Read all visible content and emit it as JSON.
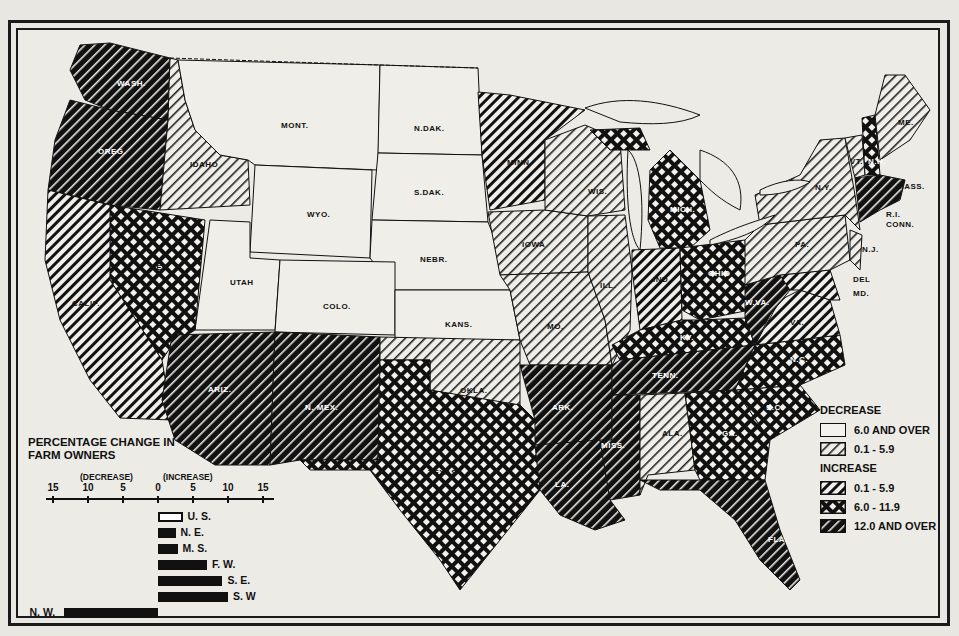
{
  "map": {
    "title_hint": "Percentage change in farm owners by state",
    "states": [
      {
        "abbr": "WASH.",
        "category": "inc_12_plus"
      },
      {
        "abbr": "OREG.",
        "category": "inc_12_plus"
      },
      {
        "abbr": "CALIF.",
        "category": "inc_0_1_5_9"
      },
      {
        "abbr": "IDAHO",
        "category": "dec_0_1_5_9"
      },
      {
        "abbr": "NEV.",
        "category": "inc_6_11_9"
      },
      {
        "abbr": "MONT.",
        "category": "dec_6_plus"
      },
      {
        "abbr": "WYO.",
        "category": "dec_6_plus"
      },
      {
        "abbr": "UTAH",
        "category": "dec_6_plus"
      },
      {
        "abbr": "COLO.",
        "category": "dec_6_plus"
      },
      {
        "abbr": "ARIZ.",
        "category": "inc_12_plus"
      },
      {
        "abbr": "N. MEX.",
        "category": "inc_12_plus"
      },
      {
        "abbr": "N.DAK.",
        "category": "dec_6_plus"
      },
      {
        "abbr": "S.DAK.",
        "category": "dec_6_plus"
      },
      {
        "abbr": "NEBR.",
        "category": "dec_6_plus"
      },
      {
        "abbr": "KANS.",
        "category": "dec_6_plus"
      },
      {
        "abbr": "OKLA.",
        "category": "dec_0_1_5_9"
      },
      {
        "abbr": "TEXAS",
        "category": "inc_6_11_9"
      },
      {
        "abbr": "MINN.",
        "category": "inc_0_1_5_9"
      },
      {
        "abbr": "IOWA",
        "category": "dec_0_1_5_9"
      },
      {
        "abbr": "MO.",
        "category": "dec_0_1_5_9"
      },
      {
        "abbr": "ARK.",
        "category": "inc_12_plus"
      },
      {
        "abbr": "LA.",
        "category": "inc_12_plus"
      },
      {
        "abbr": "WIS.",
        "category": "dec_0_1_5_9"
      },
      {
        "abbr": "ILL.",
        "category": "dec_0_1_5_9"
      },
      {
        "abbr": "MICH.",
        "category": "inc_6_11_9"
      },
      {
        "abbr": "IND.",
        "category": "inc_0_1_5_9"
      },
      {
        "abbr": "OHIO",
        "category": "inc_6_11_9"
      },
      {
        "abbr": "KY.",
        "category": "inc_6_11_9"
      },
      {
        "abbr": "TENN.",
        "category": "inc_12_plus"
      },
      {
        "abbr": "MISS.",
        "category": "inc_12_plus"
      },
      {
        "abbr": "ALA.",
        "category": "dec_0_1_5_9"
      },
      {
        "abbr": "GA.",
        "category": "inc_6_11_9"
      },
      {
        "abbr": "FLA.",
        "category": "inc_12_plus"
      },
      {
        "abbr": "S.C.",
        "category": "inc_6_11_9"
      },
      {
        "abbr": "N.C.",
        "category": "inc_6_11_9"
      },
      {
        "abbr": "VA.",
        "category": "inc_0_1_5_9"
      },
      {
        "abbr": "W.VA.",
        "category": "inc_12_plus"
      },
      {
        "abbr": "MD.",
        "category": "inc_0_1_5_9"
      },
      {
        "abbr": "DEL",
        "category": "inc_0_1_5_9"
      },
      {
        "abbr": "PA.",
        "category": "dec_0_1_5_9"
      },
      {
        "abbr": "N.J.",
        "category": "dec_0_1_5_9"
      },
      {
        "abbr": "N.Y.",
        "category": "dec_0_1_5_9"
      },
      {
        "abbr": "VT.",
        "category": "dec_0_1_5_9"
      },
      {
        "abbr": "N.H.",
        "category": "inc_6_11_9"
      },
      {
        "abbr": "ME.",
        "category": "dec_0_1_5_9"
      },
      {
        "abbr": "MASS.",
        "category": "inc_12_plus"
      },
      {
        "abbr": "R.I.",
        "category": "inc_12_plus"
      },
      {
        "abbr": "CONN.",
        "category": "inc_12_plus"
      }
    ]
  },
  "legend": {
    "decrease_heading": "DECREASE",
    "increase_heading": "INCREASE",
    "items": [
      {
        "key": "dec_6_plus",
        "label": "6.0 AND OVER"
      },
      {
        "key": "dec_0_1_5_9",
        "label": "0.1 -  5.9"
      },
      {
        "key": "inc_0_1_5_9",
        "label": "0.1 -  5.9"
      },
      {
        "key": "inc_6_11_9",
        "label": "6.0 - 11.9"
      },
      {
        "key": "inc_12_plus",
        "label": "12.0 AND OVER"
      }
    ]
  },
  "chart_data": {
    "type": "bar",
    "orientation": "horizontal",
    "title": "PERCENTAGE CHANGE IN FARM OWNERS",
    "xlabel_left": "(DECREASE)",
    "xlabel_right": "(INCREASE)",
    "xticks": [
      "15",
      "10",
      "5",
      "0",
      "5",
      "10",
      "15"
    ],
    "xlim": [
      -15,
      15
    ],
    "categories": [
      "U. S.",
      "N. E.",
      "M. S.",
      "F. W.",
      "S. E.",
      "S. W",
      "N. W."
    ],
    "values": [
      3.5,
      2.5,
      2.8,
      7.0,
      9.2,
      10.0,
      -13.5
    ]
  },
  "inset": {
    "title_line1": "PERCENTAGE CHANGE IN",
    "title_line2": "FARM OWNERS",
    "decrease": "(DECREASE)",
    "increase": "(INCREASE)"
  }
}
